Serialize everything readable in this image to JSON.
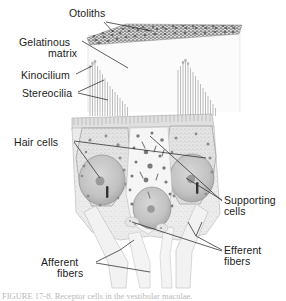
{
  "figure": {
    "caption": "FIGURE 17-8. Receptor cells in the vestibular maculae.",
    "background_color": "#ffffff",
    "ink_color": "#1b1b1b",
    "tissue_fill": "#ededed",
    "tissue_stroke": "#a8a8a8",
    "nucleus_fill": "#c9c9c9",
    "otolith_color": "#6e6e6e",
    "labels": [
      {
        "id": "otoliths",
        "text": "Otoliths",
        "x": 69,
        "y": 8,
        "align": "left"
      },
      {
        "id": "gelatinous",
        "text": "Gelatinous",
        "x": 19,
        "y": 37,
        "align": "left"
      },
      {
        "id": "matrix",
        "text": "matrix",
        "x": 48,
        "y": 48,
        "align": "left"
      },
      {
        "id": "kinocilium",
        "text": "Kinocilium",
        "x": 21,
        "y": 70,
        "align": "left"
      },
      {
        "id": "stereocilia",
        "text": "Stereocilia",
        "x": 22,
        "y": 88,
        "align": "left"
      },
      {
        "id": "hair-cells",
        "text": "Hair cells",
        "x": 14,
        "y": 137,
        "align": "left"
      },
      {
        "id": "supporting",
        "text": "Supporting",
        "x": 224,
        "y": 195,
        "align": "left"
      },
      {
        "id": "supporting-cells",
        "text": "cells",
        "x": 224,
        "y": 206,
        "align": "left"
      },
      {
        "id": "efferent",
        "text": "Efferent",
        "x": 224,
        "y": 245,
        "align": "left"
      },
      {
        "id": "efferent-fibers",
        "text": "fibers",
        "x": 224,
        "y": 256,
        "align": "left"
      },
      {
        "id": "afferent",
        "text": "Afferent",
        "x": 41,
        "y": 257,
        "align": "left"
      },
      {
        "id": "afferent-fibers",
        "text": "fibers",
        "x": 57,
        "y": 268,
        "align": "left"
      }
    ],
    "structures": [
      {
        "id": "otolith-layer",
        "name": "Otoliths granular layer"
      },
      {
        "id": "gelatinous-matrix",
        "name": "Gelatinous matrix"
      },
      {
        "id": "hair-bundle-left",
        "name": "Left stereocilia/kinocilium bundle"
      },
      {
        "id": "hair-bundle-right",
        "name": "Right stereocilia/kinocilium bundle"
      },
      {
        "id": "hair-cell-left",
        "name": "Left hair cell body"
      },
      {
        "id": "hair-cell-right",
        "name": "Right hair cell body"
      },
      {
        "id": "supporting-cell-center",
        "name": "Central supporting cell"
      },
      {
        "id": "nerve-fibers",
        "name": "Afferent and efferent nerve fibers"
      }
    ]
  }
}
